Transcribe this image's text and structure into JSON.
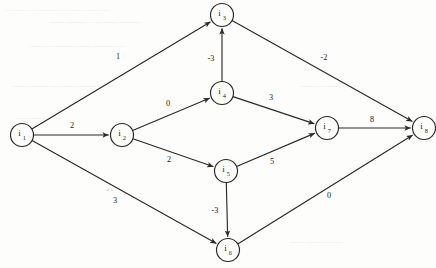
{
  "graph": {
    "title": "Directed weighted graph",
    "type": "directed-weighted-graph",
    "node_radius": 11.5,
    "nodes": [
      {
        "id": "i1",
        "label": "i",
        "sub": "1",
        "x": 22,
        "y": 135
      },
      {
        "id": "i2",
        "label": "i",
        "sub": "2",
        "x": 122,
        "y": 135
      },
      {
        "id": "i3",
        "label": "i",
        "sub": "3",
        "x": 222,
        "y": 15
      },
      {
        "id": "i4",
        "label": "i",
        "sub": "4",
        "x": 222,
        "y": 93
      },
      {
        "id": "i5",
        "label": "i",
        "sub": "5",
        "x": 226,
        "y": 171
      },
      {
        "id": "i6",
        "label": "i",
        "sub": "6",
        "x": 228,
        "y": 250
      },
      {
        "id": "i7",
        "label": "i",
        "sub": "7",
        "x": 327,
        "y": 128
      },
      {
        "id": "i8",
        "label": "i",
        "sub": "8",
        "x": 424,
        "y": 128
      }
    ],
    "edges": [
      {
        "from": "i1",
        "to": "i3",
        "weight": "1",
        "lx": 118,
        "ly": 59
      },
      {
        "from": "i1",
        "to": "i2",
        "weight": "2",
        "lx": 72,
        "ly": 128
      },
      {
        "from": "i1",
        "to": "i6",
        "weight": "3",
        "lx": 115,
        "ly": 203
      },
      {
        "from": "i2",
        "to": "i4",
        "weight": "0",
        "lx": 168,
        "ly": 106
      },
      {
        "from": "i2",
        "to": "i5",
        "weight": "2",
        "lx": 169,
        "ly": 162
      },
      {
        "from": "i4",
        "to": "i3",
        "weight": "-3",
        "lx": 211,
        "ly": 61
      },
      {
        "from": "i4",
        "to": "i7",
        "weight": "3",
        "lx": 271,
        "ly": 100
      },
      {
        "from": "i5",
        "to": "i7",
        "weight": "5",
        "lx": 272,
        "ly": 164
      },
      {
        "from": "i5",
        "to": "i6",
        "weight": "-3",
        "lx": 215,
        "ly": 213
      },
      {
        "from": "i3",
        "to": "i8",
        "weight": "-2",
        "lx": 324,
        "ly": 60
      },
      {
        "from": "i7",
        "to": "i8",
        "weight": "8",
        "lx": 372,
        "ly": 122
      },
      {
        "from": "i6",
        "to": "i8",
        "weight": "0",
        "lx": 329,
        "ly": 198
      }
    ]
  },
  "background_marks": {
    "description": "faint show-through text from reverse of scanned page",
    "rows": [
      {
        "x": 6,
        "y": 12,
        "text": "—   ——  —   ———  — ——  —— —"
      },
      {
        "x": 50,
        "y": 24,
        "text": "——  ———  ——   —— ———"
      },
      {
        "x": 30,
        "y": 48,
        "text": "——   —  ———  ——  ———  —"
      },
      {
        "x": 12,
        "y": 88,
        "text": "——  ———  —  ——   ———  ——"
      },
      {
        "x": 300,
        "y": 88,
        "text": "——  —  ———"
      },
      {
        "x": 16,
        "y": 120,
        "text": "—  ———   ——"
      },
      {
        "x": 290,
        "y": 244,
        "text": "——  ———  ——"
      }
    ]
  }
}
